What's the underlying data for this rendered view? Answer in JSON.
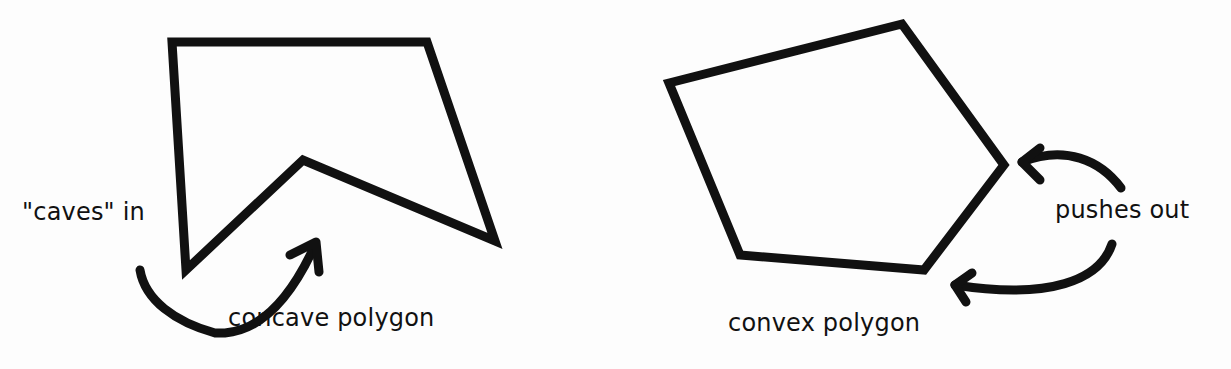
{
  "diagram": {
    "concave": {
      "label": "concave polygon",
      "annotation": "\"caves\" in",
      "points": "172,42 427,42 495,241 303,160 186,270"
    },
    "convex": {
      "label": "convex polygon",
      "annotation": "pushes out",
      "points": "669,83 902,24 1004,165 924,270 740,255"
    },
    "stroke_color": "#111111",
    "background": "#fdfdfd"
  }
}
